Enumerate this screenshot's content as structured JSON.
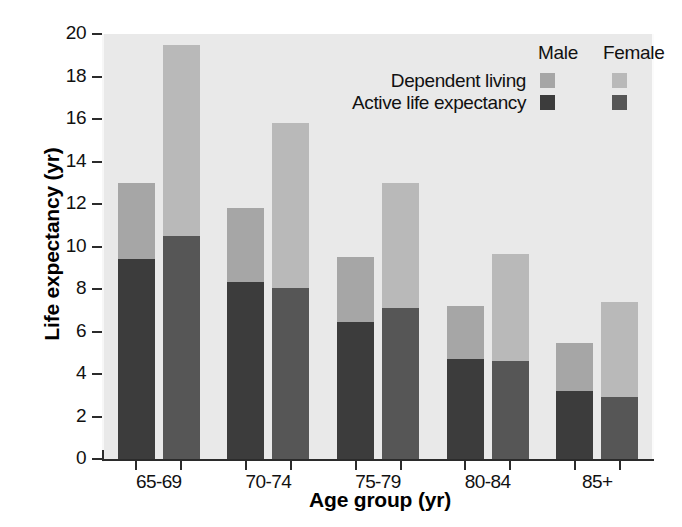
{
  "chart_data": {
    "type": "bar",
    "subtype": "grouped-stacked",
    "title": "",
    "xlabel": "Age group (yr)",
    "ylabel": "Life expectancy (yr)",
    "categories": [
      "65-69",
      "70-74",
      "75-79",
      "80-84",
      "85+"
    ],
    "ylim": [
      0,
      20
    ],
    "ytick_values": [
      0,
      2,
      4,
      6,
      8,
      10,
      12,
      14,
      16,
      18,
      20
    ],
    "ytick_labels": [
      "0",
      "2",
      "4",
      "6",
      "8",
      "10",
      "12",
      "14",
      "16",
      "18",
      "20"
    ],
    "grid": false,
    "legend_position": "top-right-inside",
    "stack_order": [
      "Active life expectancy",
      "Dependent living"
    ],
    "series": [
      {
        "name": "Male — Active life expectancy",
        "group": "Male",
        "segment": "Active life expectancy",
        "color": "#3c3c3c",
        "values": [
          9.4,
          8.35,
          6.45,
          4.7,
          3.2
        ]
      },
      {
        "name": "Male — Dependent living",
        "group": "Male",
        "segment": "Dependent living",
        "color": "#a6a6a6",
        "values": [
          3.6,
          3.45,
          3.05,
          2.5,
          2.25
        ]
      },
      {
        "name": "Female — Active life expectancy",
        "group": "Female",
        "segment": "Active life expectancy",
        "color": "#565656",
        "values": [
          10.5,
          8.05,
          7.1,
          4.6,
          2.9
        ]
      },
      {
        "name": "Female — Dependent living",
        "group": "Female",
        "segment": "Dependent living",
        "color": "#b9b9b9",
        "values": [
          9.0,
          7.75,
          5.9,
          5.05,
          4.5
        ]
      }
    ],
    "totals": {
      "Male": [
        13.0,
        11.8,
        9.5,
        7.2,
        5.45
      ],
      "Female": [
        19.5,
        15.8,
        13.0,
        9.65,
        7.4
      ]
    }
  },
  "axes": {
    "y_title": "Life expectancy (yr)",
    "x_title": "Age group (yr)",
    "y_ticks": [
      "20",
      "18",
      "16",
      "14",
      "12",
      "10",
      "8",
      "6",
      "4",
      "2",
      "0"
    ],
    "x_ticks": [
      "65-69",
      "70-74",
      "75-79",
      "80-84",
      "85+"
    ]
  },
  "legend": {
    "col_headers": [
      "Male",
      "Female"
    ],
    "male_header": "Male",
    "female_header": "Female",
    "rows": [
      {
        "label": "Dependent living",
        "male_color": "#a6a6a6",
        "female_color": "#b9b9b9"
      },
      {
        "label": "Active life expectancy",
        "male_color": "#3c3c3c",
        "female_color": "#565656"
      }
    ],
    "row0_label": "Dependent living",
    "row1_label": "Active life expectancy"
  },
  "colors": {
    "plot_background": "#e9e9e9",
    "page_background": "#ffffff",
    "axis": "#2b2b2b",
    "male_dependent": "#a6a6a6",
    "male_active": "#3c3c3c",
    "female_dependent": "#b9b9b9",
    "female_active": "#565656"
  }
}
